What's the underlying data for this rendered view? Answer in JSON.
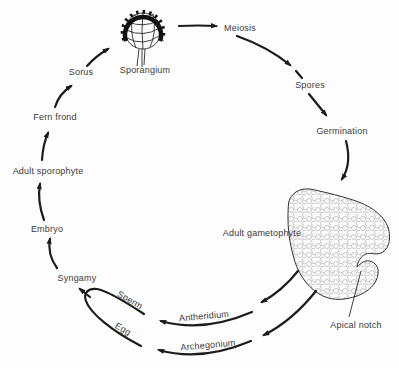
{
  "colors": {
    "background": "#fdfdfd",
    "line": "#1c1c1c",
    "text": "#3a3a3a",
    "cell_texture": "#9b9b9b"
  },
  "labels": {
    "sporangium": {
      "text": "Sporangium"
    },
    "meiosis": {
      "text": "Meiosis"
    },
    "spores": {
      "text": "Spores"
    },
    "germination": {
      "text": "Germination"
    },
    "adult_gametophyte": {
      "text": "Adult gametophyte"
    },
    "apical_notch": {
      "text": "Apical notch"
    },
    "antheridium": {
      "text": "Antheridium"
    },
    "archegonium": {
      "text": "Archegonium"
    },
    "sperm": {
      "text": "Sperm"
    },
    "egg": {
      "text": "Egg"
    },
    "syngamy": {
      "text": "Syngamy"
    },
    "embryo": {
      "text": "Embryo"
    },
    "adult_sporophyte": {
      "text": "Adult sporophyte"
    },
    "fern_frond": {
      "text": "Fern frond"
    },
    "sorus": {
      "text": "Sorus"
    }
  },
  "cycle_flow": [
    {
      "from": "Sporangium",
      "to": "Meiosis"
    },
    {
      "from": "Meiosis",
      "to": "Spores"
    },
    {
      "from": "Spores",
      "to": "Germination"
    },
    {
      "from": "Germination",
      "to": "Adult gametophyte"
    },
    {
      "from": "Adult gametophyte",
      "to": "Antheridium"
    },
    {
      "from": "Adult gametophyte",
      "to": "Archegonium"
    },
    {
      "from": "Antheridium",
      "to": "Sperm"
    },
    {
      "from": "Archegonium",
      "to": "Egg"
    },
    {
      "from": "Sperm",
      "to": "Syngamy"
    },
    {
      "from": "Egg",
      "to": "Syngamy"
    },
    {
      "from": "Syngamy",
      "to": "Embryo"
    },
    {
      "from": "Embryo",
      "to": "Adult sporophyte"
    },
    {
      "from": "Adult sporophyte",
      "to": "Fern frond"
    },
    {
      "from": "Fern frond",
      "to": "Sorus"
    },
    {
      "from": "Sorus",
      "to": "Sporangium"
    }
  ]
}
